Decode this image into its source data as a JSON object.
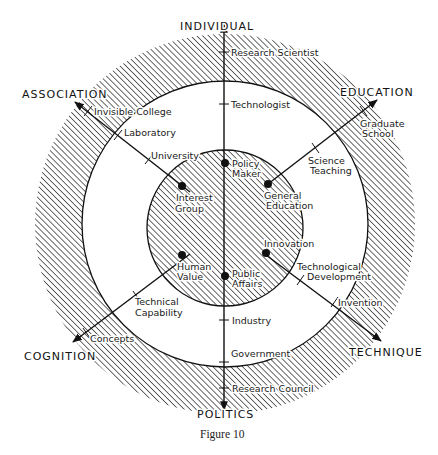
{
  "figure": {
    "caption": "Figure 10",
    "colors": {
      "ink": "#1a1a1a",
      "background": "#ffffff"
    },
    "rings": [
      {
        "name": "outer-ring",
        "style": "hatched"
      },
      {
        "name": "middle-ring",
        "style": "white"
      },
      {
        "name": "inner-circle",
        "style": "hatched"
      }
    ],
    "axes": {
      "individual": {
        "label": "INDIVIDUAL",
        "terms": [
          "Research Scientist",
          "Technologist",
          "Policy Maker"
        ]
      },
      "education": {
        "label": "EDUCATION",
        "terms": [
          "Graduate School",
          "Science Teaching",
          "General Education"
        ]
      },
      "technique": {
        "label": "TECHNIQUE",
        "terms": [
          "Invention",
          "Technological Development",
          "Innovation"
        ]
      },
      "politics": {
        "label": "POLITICS",
        "terms": [
          "Research Council",
          "Government",
          "Industry",
          "Public Affairs"
        ]
      },
      "cognition": {
        "label": "COGNITION",
        "terms": [
          "Concepts",
          "Technical Capability",
          "Human Value"
        ]
      },
      "association": {
        "label": "ASSOCIATION",
        "terms": [
          "Invisible College",
          "Laboratory",
          "University",
          "Interest Group"
        ]
      }
    },
    "labels": {
      "research_scientist": "Research Scientist",
      "technologist": "Technologist",
      "policy_maker_1": "Policy",
      "policy_maker_2": "Maker",
      "graduate_school_1": "Graduate",
      "graduate_school_2": "School",
      "science_teaching_1": "Science",
      "science_teaching_2": "Teaching",
      "general_education_1": "General",
      "general_education_2": "Education",
      "invention": "Invention",
      "tech_dev_1": "Technological",
      "tech_dev_2": "Development",
      "innovation": "Innovation",
      "research_council": "Research Council",
      "government": "Government",
      "industry": "Industry",
      "public_affairs_1": "Public",
      "public_affairs_2": "Affairs",
      "concepts": "Concepts",
      "technical_capability_1": "Technical",
      "technical_capability_2": "Capability",
      "human_value_1": "Human",
      "human_value_2": "Value",
      "invisible_college": "Invisible College",
      "laboratory": "Laboratory",
      "university": "University",
      "interest_group_1": "Interest",
      "interest_group_2": "Group"
    }
  }
}
